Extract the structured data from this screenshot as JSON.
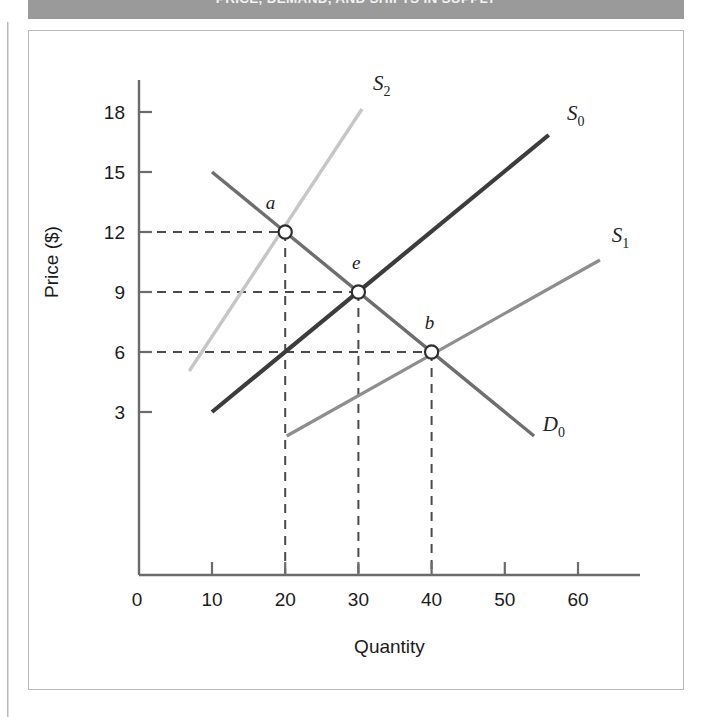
{
  "banner": {
    "text": "PRICE, DEMAND, AND SHIFTS IN SUPPLY"
  },
  "chart_data": {
    "type": "line",
    "title": "",
    "xlabel": "Quantity",
    "ylabel": "Price ($)",
    "xlim": [
      0,
      66
    ],
    "ylim": [
      0,
      19.5
    ],
    "xticks": [
      "0",
      "10",
      "20",
      "30",
      "40",
      "50",
      "60"
    ],
    "xtick_values": [
      0,
      10,
      20,
      30,
      40,
      50,
      60
    ],
    "yticks": [
      "3",
      "6",
      "9",
      "12",
      "15",
      "18"
    ],
    "ytick_values": [
      3,
      6,
      9,
      12,
      15,
      18
    ],
    "grid": false,
    "legend_position": "inline-end-of-curve",
    "series": [
      {
        "name": "S0",
        "label": "S",
        "subscript": "0",
        "role": "supply-original",
        "color": "#3c3c3c",
        "width": 4.2,
        "x": [
          10,
          56
        ],
        "y": [
          3,
          16.85
        ],
        "label_x": 58.5,
        "label_y": 17.6
      },
      {
        "name": "S1",
        "label": "S",
        "subscript": "1",
        "role": "supply-increase",
        "color": "#8e8e8e",
        "width": 3.2,
        "x": [
          20.2,
          63
        ],
        "y": [
          1.8,
          10.6
        ],
        "label_x": 64.6,
        "label_y": 11.5
      },
      {
        "name": "S2",
        "label": "S",
        "subscript": "2",
        "role": "supply-decrease",
        "color": "#c6c6c6",
        "width": 3.4,
        "x": [
          6.9,
          30.5
        ],
        "y": [
          5.05,
          18.15
        ],
        "label_x": 32,
        "label_y": 19.1
      },
      {
        "name": "D0",
        "label": "D",
        "subscript": "0",
        "role": "demand",
        "color": "#6e6e6e",
        "width": 3.4,
        "x": [
          10,
          54
        ],
        "y": [
          15,
          1.8
        ],
        "label_x": 55.2,
        "label_y": 2.05
      }
    ],
    "points": [
      {
        "name": "a",
        "label": "a",
        "x": 20,
        "y": 12,
        "intersection_of": [
          "S2",
          "D0"
        ],
        "label_dx": -2,
        "label_dy": 1.15
      },
      {
        "name": "e",
        "label": "e",
        "x": 30,
        "y": 9,
        "intersection_of": [
          "S0",
          "D0"
        ],
        "label_dx": -0.3,
        "label_dy": 1.15
      },
      {
        "name": "b",
        "label": "b",
        "x": 40,
        "y": 6,
        "intersection_of": [
          "S1",
          "D0"
        ],
        "label_dx": -0.3,
        "label_dy": 1.15
      }
    ],
    "guidelines": {
      "style": "dashed",
      "color": "#4a4a4a",
      "horizontal_from_axis": [
        12,
        9,
        6
      ],
      "vertical_from_axis": [
        20,
        30,
        40
      ]
    }
  },
  "colors": {
    "banner_bg": "#9a9a9a",
    "frame_border": "#b9b9b9",
    "axis": "#6b6b6b",
    "text": "#1b1b1b"
  }
}
